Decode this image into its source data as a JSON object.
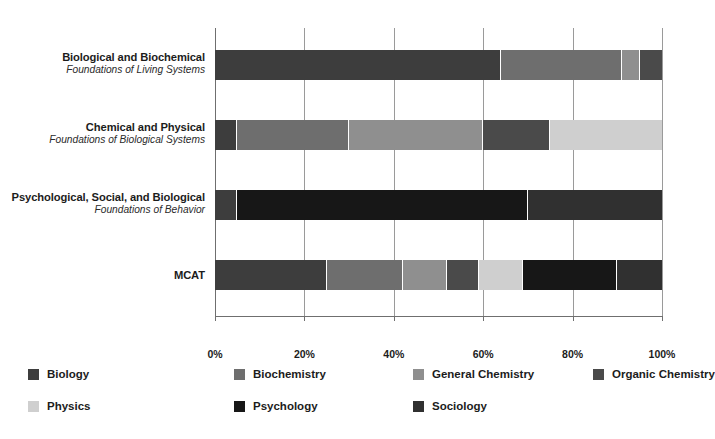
{
  "chart_data": {
    "type": "bar",
    "orientation": "horizontal",
    "stacked": true,
    "stack_mode": "percent",
    "title": "",
    "xlabel": "",
    "ylabel": "",
    "xlim": [
      0,
      100
    ],
    "xticks": [
      0,
      20,
      40,
      60,
      80,
      100
    ],
    "xtick_labels": [
      "0%",
      "20%",
      "40%",
      "60%",
      "80%",
      "100%"
    ],
    "grid": true,
    "legend_position": "bottom",
    "categories": [
      {
        "main": "Biological and Biochemical",
        "sub": "Foundations of Living Systems"
      },
      {
        "main": "Chemical and Physical",
        "sub": "Foundations of Biological Systems"
      },
      {
        "main": "Psychological, Social, and Biological",
        "sub": "Foundations of Behavior"
      },
      {
        "main": "MCAT",
        "sub": ""
      }
    ],
    "series": [
      {
        "name": "Biology",
        "color": "#3d3d3d",
        "values": [
          64,
          5,
          5,
          25
        ]
      },
      {
        "name": "Biochemistry",
        "color": "#6e6e6e",
        "values": [
          27,
          25,
          0,
          17
        ]
      },
      {
        "name": "General Chemistry",
        "color": "#8f8f8f",
        "values": [
          4,
          30,
          0,
          10
        ]
      },
      {
        "name": "Organic Chemistry",
        "color": "#4a4a4a",
        "values": [
          5,
          15,
          0,
          7
        ]
      },
      {
        "name": "Physics",
        "color": "#cfcfcf",
        "values": [
          0,
          25,
          0,
          10
        ]
      },
      {
        "name": "Psychology",
        "color": "#171717",
        "values": [
          0,
          0,
          65,
          21
        ]
      },
      {
        "name": "Sociology",
        "color": "#303030",
        "values": [
          0,
          0,
          30,
          10
        ]
      }
    ]
  },
  "legend": {
    "items": [
      {
        "label": "Biology",
        "color": "#3d3d3d"
      },
      {
        "label": "Biochemistry",
        "color": "#6e6e6e"
      },
      {
        "label": "General Chemistry",
        "color": "#8f8f8f"
      },
      {
        "label": "Organic Chemistry",
        "color": "#4a4a4a"
      },
      {
        "label": "Physics",
        "color": "#cfcfcf"
      },
      {
        "label": "Psychology",
        "color": "#171717"
      },
      {
        "label": "Sociology",
        "color": "#303030"
      }
    ]
  }
}
